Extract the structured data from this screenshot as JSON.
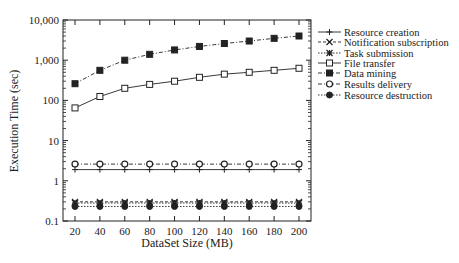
{
  "chart_data": {
    "type": "line",
    "title": "",
    "xlabel": "DataSet Size (MB)",
    "ylabel": "Execution Time (sec)",
    "x": [
      20,
      40,
      60,
      80,
      100,
      120,
      140,
      160,
      180,
      200
    ],
    "xlim": [
      20,
      200
    ],
    "ylim": [
      0.1,
      10000
    ],
    "yscale": "log",
    "y_ticks": [
      0.1,
      1,
      10,
      100,
      1000,
      10000
    ],
    "y_tick_labels": [
      "0.1",
      "1",
      "10",
      "100",
      "1,000",
      "10,000"
    ],
    "x_tick_labels": [
      "20",
      "40",
      "60",
      "80",
      "100",
      "120",
      "140",
      "160",
      "180",
      "200"
    ],
    "grid": false,
    "legend_position": "right-outside",
    "series": [
      {
        "name": "Resource creation",
        "marker": "plus",
        "line": "solid",
        "values": [
          1.9,
          1.9,
          1.9,
          1.9,
          1.9,
          1.9,
          1.9,
          1.9,
          1.9,
          1.9
        ]
      },
      {
        "name": "Notification subscription",
        "marker": "x",
        "line": "dashed",
        "values": [
          0.3,
          0.3,
          0.3,
          0.3,
          0.3,
          0.3,
          0.3,
          0.3,
          0.3,
          0.3
        ]
      },
      {
        "name": "Task submission",
        "marker": "asterisk",
        "line": "dotted",
        "values": [
          0.28,
          0.28,
          0.28,
          0.28,
          0.28,
          0.28,
          0.28,
          0.28,
          0.28,
          0.28
        ]
      },
      {
        "name": "File transfer",
        "marker": "square-open",
        "line": "solid",
        "values": [
          65,
          125,
          200,
          250,
          300,
          375,
          450,
          500,
          560,
          630
        ]
      },
      {
        "name": "Data mining",
        "marker": "square-filled",
        "line": "dashdot",
        "values": [
          260,
          560,
          1000,
          1400,
          1800,
          2200,
          2600,
          3000,
          3500,
          4000
        ]
      },
      {
        "name": "Results delivery",
        "marker": "circle-open",
        "line": "dashdot",
        "values": [
          2.6,
          2.6,
          2.6,
          2.6,
          2.6,
          2.6,
          2.6,
          2.6,
          2.6,
          2.6
        ]
      },
      {
        "name": "Resource destruction",
        "marker": "circle-filled",
        "line": "dotted",
        "values": [
          0.23,
          0.23,
          0.23,
          0.23,
          0.23,
          0.23,
          0.23,
          0.23,
          0.23,
          0.23
        ]
      }
    ]
  },
  "colors": {
    "ink": "#222222",
    "background": "#ffffff"
  }
}
